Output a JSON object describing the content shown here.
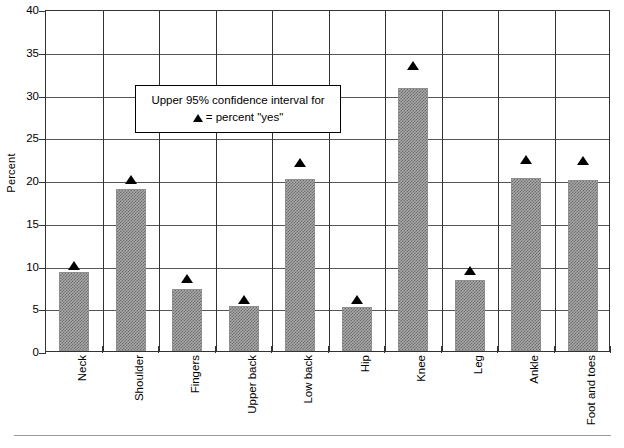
{
  "chart_data": {
    "type": "bar",
    "title": "",
    "xlabel": "",
    "ylabel": "Percent",
    "ylim": [
      0,
      40
    ],
    "yticks": [
      "0",
      "5",
      "10",
      "15",
      "20",
      "25",
      "30",
      "35",
      "40"
    ],
    "ytick_values": [
      0,
      5,
      10,
      15,
      20,
      25,
      30,
      35,
      40
    ],
    "grid": true,
    "legend_position": "inside-upper-left",
    "categories": [
      "Neck",
      "Shoulder",
      "Fingers",
      "Upper back",
      "Low back",
      "Hip",
      "Knee",
      "Leg",
      "Ankle",
      "Foot and toes"
    ],
    "series": [
      {
        "name": "percent \"yes\"",
        "type": "bar",
        "values": [
          9.2,
          19.0,
          7.2,
          5.3,
          20.1,
          5.2,
          30.8,
          8.3,
          20.2,
          20.0
        ]
      },
      {
        "name": "Upper 95% confidence interval",
        "type": "marker",
        "marker": "triangle",
        "values": [
          10.2,
          20.3,
          8.7,
          6.3,
          22.3,
          6.3,
          33.6,
          9.7,
          22.6,
          22.5
        ]
      }
    ],
    "annotations": {
      "legend_line1": "Upper 95% confidence interval for",
      "legend_line2_symbol": "▲",
      "legend_line2_text": "= percent \"yes\""
    }
  }
}
